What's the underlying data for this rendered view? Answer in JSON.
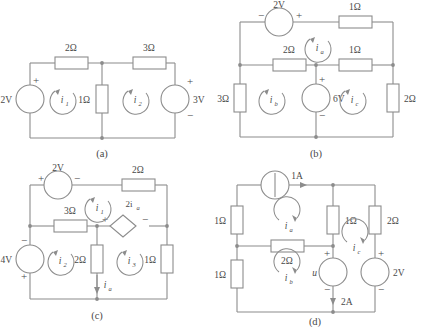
{
  "figure": {
    "title": "",
    "background": "#ffffff",
    "line_color": "#8c8c8c",
    "text_color": "#4a4a4a"
  },
  "circuits": [
    {
      "id": "a",
      "caption": "(a)",
      "sources": [
        {
          "name": "source-2v-left",
          "label": "2V",
          "type": "voltage",
          "plus": "+",
          "minus": "",
          "orientation": "vertical",
          "polarity_top": "+"
        },
        {
          "name": "source-3v-right",
          "label": "3V",
          "type": "voltage",
          "plus": "+",
          "minus": "−",
          "orientation": "vertical",
          "polarity_top": "+"
        }
      ],
      "resistors": [
        {
          "name": "resistor-2ohm-top-left",
          "label": "2Ω"
        },
        {
          "name": "resistor-3ohm-top-right",
          "label": "3Ω"
        },
        {
          "name": "resistor-1ohm-middle",
          "label": "1Ω"
        }
      ],
      "meshes": [
        {
          "name": "mesh-current-i1",
          "symbol": "i",
          "subscript": "1"
        },
        {
          "name": "mesh-current-i2",
          "symbol": "i",
          "subscript": "2"
        }
      ]
    },
    {
      "id": "b",
      "caption": "(b)",
      "sources": [
        {
          "name": "source-2v-top",
          "label": "2V",
          "type": "voltage",
          "plus": "+",
          "minus": "−",
          "orientation": "horizontal",
          "polarity_left": "−",
          "polarity_right": "+"
        },
        {
          "name": "source-6v-middle",
          "label": "6V",
          "type": "voltage",
          "plus": "+",
          "minus": "−",
          "orientation": "vertical",
          "polarity_top": "+"
        }
      ],
      "resistors": [
        {
          "name": "resistor-1ohm-top-right",
          "label": "1Ω"
        },
        {
          "name": "resistor-2ohm-mid-left",
          "label": "2Ω"
        },
        {
          "name": "resistor-1ohm-mid-right",
          "label": "1Ω"
        },
        {
          "name": "resistor-3ohm-left",
          "label": "3Ω"
        },
        {
          "name": "resistor-2ohm-right",
          "label": "2Ω"
        }
      ],
      "meshes": [
        {
          "name": "mesh-current-ia",
          "symbol": "i",
          "subscript": "a"
        },
        {
          "name": "mesh-current-ib",
          "symbol": "i",
          "subscript": "b"
        },
        {
          "name": "mesh-current-ic",
          "symbol": "i",
          "subscript": "c"
        }
      ]
    },
    {
      "id": "c",
      "caption": "(c)",
      "sources": [
        {
          "name": "source-2v-top",
          "label": "2V",
          "type": "voltage",
          "plus": "+",
          "minus": "−",
          "orientation": "horizontal",
          "polarity_left": "+",
          "polarity_right": "−"
        },
        {
          "name": "source-4v-left",
          "label": "4V",
          "type": "voltage",
          "plus": "+",
          "minus": "−",
          "orientation": "vertical",
          "polarity_top": "−"
        },
        {
          "name": "dependent-source-2ia",
          "label": "2i",
          "subscript": "a",
          "type": "dependent-voltage",
          "plus": "+",
          "minus": "−",
          "shape": "diamond"
        }
      ],
      "resistors": [
        {
          "name": "resistor-2ohm-top-right",
          "label": "2Ω"
        },
        {
          "name": "resistor-3ohm-middle-left",
          "label": "3Ω"
        },
        {
          "name": "resistor-2ohm-vertical",
          "label": "2Ω"
        },
        {
          "name": "resistor-1ohm-right",
          "label": "1Ω"
        }
      ],
      "branch_currents": [
        {
          "name": "branch-current-ia",
          "symbol": "i",
          "subscript": "a",
          "direction": "down"
        }
      ],
      "meshes": [
        {
          "name": "mesh-current-i1",
          "symbol": "i",
          "subscript": "1"
        },
        {
          "name": "mesh-current-i2",
          "symbol": "i",
          "subscript": "2"
        },
        {
          "name": "mesh-current-i3",
          "symbol": "i",
          "subscript": "3"
        }
      ]
    },
    {
      "id": "d",
      "caption": "(d)",
      "sources": [
        {
          "name": "source-1a-top",
          "label": "1A",
          "type": "current"
        },
        {
          "name": "source-u-middle",
          "label": "u",
          "type": "voltage",
          "plus": "+",
          "minus": "−",
          "orientation": "vertical",
          "polarity_top": "+"
        },
        {
          "name": "current-2a-label",
          "label": "2A",
          "type": "current-annotation",
          "direction": "down"
        },
        {
          "name": "source-2v-right",
          "label": "2V",
          "type": "voltage",
          "plus": "+",
          "minus": "−",
          "orientation": "vertical",
          "polarity_top": "+"
        }
      ],
      "resistors": [
        {
          "name": "resistor-1ohm-upper-left",
          "label": "1Ω"
        },
        {
          "name": "resistor-1ohm-lower-left",
          "label": "1Ω"
        },
        {
          "name": "resistor-2ohm-middle",
          "label": "2Ω"
        },
        {
          "name": "resistor-1ohm-middle-vertical",
          "label": "1Ω"
        },
        {
          "name": "resistor-2ohm-right",
          "label": "2Ω"
        }
      ],
      "meshes": [
        {
          "name": "mesh-current-ia",
          "symbol": "i",
          "subscript": "a"
        },
        {
          "name": "mesh-current-ib",
          "symbol": "i",
          "subscript": "b"
        },
        {
          "name": "mesh-current-ic",
          "symbol": "i",
          "subscript": "c"
        }
      ]
    }
  ]
}
